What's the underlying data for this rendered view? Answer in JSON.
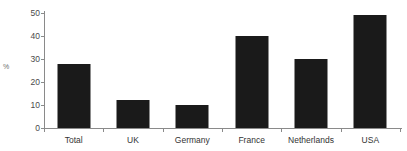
{
  "chart_data": {
    "type": "bar",
    "title": "",
    "xlabel": "",
    "ylabel": "%",
    "categories": [
      "Total",
      "UK",
      "Germany",
      "France",
      "Netherlands",
      "USA"
    ],
    "values": [
      28,
      12,
      10,
      40,
      30,
      49
    ],
    "ylim": [
      0,
      50
    ],
    "yticks": [
      0,
      10,
      20,
      30,
      40,
      50
    ],
    "ytick_labels": [
      "0",
      "10",
      "20",
      "30",
      "40",
      "50"
    ],
    "grid": false,
    "legend": false,
    "series": [
      {
        "name": "",
        "values": [
          28,
          12,
          10,
          40,
          30,
          49
        ]
      }
    ],
    "colors": {
      "bar": "#1a1a1a",
      "axis": "#8a8a8a",
      "tick_text": "#4a4a4a",
      "category_text": "#333333",
      "axis_label": "#6d6d6d",
      "background": "#ffffff"
    }
  }
}
